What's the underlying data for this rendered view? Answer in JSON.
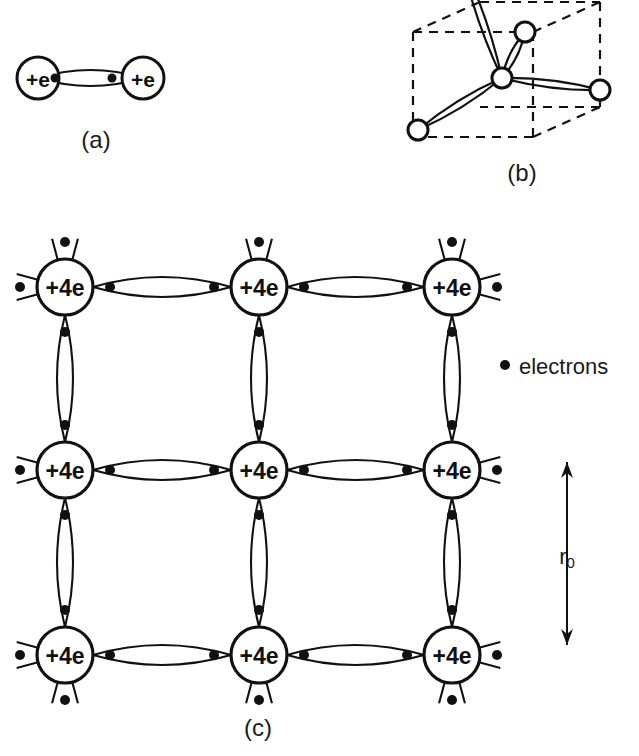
{
  "figure": {
    "background_color": "#ffffff",
    "ink_color": "#111111",
    "panels": [
      {
        "id": "a",
        "label": "(a)",
        "label_x": 96,
        "label_y": 139,
        "description": "two-atom covalent bond",
        "atom_label": "+e",
        "atom_radius": 21,
        "atom_font_size": 21,
        "atoms": [
          {
            "cx": 38,
            "cy": 78
          },
          {
            "cx": 143,
            "cy": 78
          }
        ],
        "electron_dots": [
          {
            "cx": 55,
            "cy": 78
          },
          {
            "cx": 112,
            "cy": 78
          }
        ],
        "dot_radius": 4.5,
        "bond": {
          "x1": 38,
          "x2": 143,
          "cy": 78,
          "bulge": 16
        }
      },
      {
        "id": "b",
        "label": "(b)",
        "label_x": 522,
        "label_y": 172,
        "description": "tetrahedral bond arrangement in a cube",
        "node_radius": 10,
        "cube": {
          "front": {
            "x": 413,
            "y": 32,
            "w": 120,
            "h": 105
          },
          "offset_x": 67,
          "offset_y": -30
        },
        "center_atom": {
          "cx": 502,
          "cy": 78
        },
        "corner_atoms": [
          {
            "cx": 525,
            "cy": 32
          },
          {
            "cx": 600,
            "cy": 90
          },
          {
            "cx": 418,
            "cy": 130
          },
          {
            "cx": 462,
            "cy": -38
          }
        ]
      },
      {
        "id": "c",
        "label": "(c)",
        "label_x": 258,
        "label_y": 727,
        "description": "two-dimensional silicon lattice with shared valence electrons",
        "atom_label": "+4e",
        "atom_radius": 28,
        "atom_font_size": 23,
        "dot_radius": 5,
        "columns_x": [
          65,
          259,
          452
        ],
        "rows_y": [
          287,
          470,
          655
        ],
        "bond_bulge_h": 20,
        "bond_bulge_v": 16,
        "dot_gap": 17,
        "stub_length": 22
      }
    ],
    "legend": {
      "dot_x": 505,
      "dot_y": 365,
      "dot_radius": 5,
      "text_x": 519,
      "text_y": 366,
      "label": "electrons"
    },
    "dimension": {
      "axis_x": 567,
      "y_top": 462,
      "y_bottom": 645,
      "label": "r",
      "label_sub": "0",
      "label_x": 567,
      "label_y": 556
    }
  }
}
